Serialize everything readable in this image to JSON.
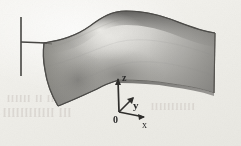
{
  "figure": {
    "kind": "3d-shaded-surface-plot",
    "background_color": "#f1f0eb",
    "ink_color": "#2b2b2b"
  },
  "axes": {
    "origin_label": "0",
    "x_label": "x",
    "y_label": "y",
    "z_label": "z",
    "origin_point": {
      "x": 119,
      "y": 112
    },
    "x_axis_end": {
      "x": 142,
      "y": 117
    },
    "y_axis_end": {
      "x": 131,
      "y": 101
    },
    "z_axis_end": {
      "x": 118,
      "y": 79
    }
  },
  "reference_line": {
    "name": "vertical-reference-line",
    "x": 21,
    "y_top": 17,
    "y_bottom": 76,
    "tick_y": 42,
    "tick_x_end": 47
  },
  "surface": {
    "fill_light": "#dcdbd7",
    "fill_mid": "#a9a8a4",
    "fill_dark": "#7e7d7a",
    "edge_color": "#5b5a58",
    "highlight_center": {
      "x": 108,
      "y": 34
    },
    "cusp_point": {
      "x": 119,
      "y": 80
    }
  },
  "ghost_text": {
    "line_1": "ll ll llllll",
    "line_2": "lll llllllllllll",
    "line_3": "lllllllllll"
  }
}
